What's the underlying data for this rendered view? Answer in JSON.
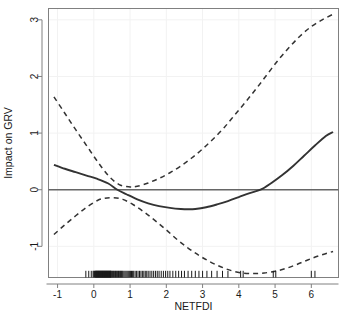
{
  "chart_data": {
    "type": "line",
    "title": "",
    "xlabel": "NETFDI",
    "ylabel": "Impact on GRV",
    "xlim": [
      -1.25,
      6.75
    ],
    "ylim": [
      -1.55,
      3.2
    ],
    "xticks": [
      -1,
      0,
      1,
      2,
      3,
      4,
      5,
      6
    ],
    "xtick_labels": [
      "-1",
      "0",
      "1",
      "2",
      "3",
      "4",
      "5",
      "6"
    ],
    "yticks": [
      -1,
      0,
      1,
      2,
      3
    ],
    "ytick_labels": [
      "-1",
      "0",
      "1",
      "2",
      "3"
    ],
    "grid": false,
    "legend": null,
    "reference_line_y": 0,
    "series": [
      {
        "name": "Estimated smooth effect",
        "style": "solid",
        "color": "#333333",
        "x": [
          -1.1,
          -0.8,
          -0.5,
          -0.2,
          0.1,
          0.4,
          0.65,
          0.9,
          1.2,
          1.5,
          1.8,
          2.1,
          2.4,
          2.6,
          2.8,
          3.1,
          3.4,
          3.7,
          4.0,
          4.3,
          4.6,
          4.9,
          5.2,
          5.5,
          5.8,
          6.1,
          6.4,
          6.6
        ],
        "values": [
          0.44,
          0.37,
          0.31,
          0.25,
          0.19,
          0.11,
          0.0,
          -0.08,
          -0.17,
          -0.24,
          -0.29,
          -0.32,
          -0.34,
          -0.345,
          -0.34,
          -0.31,
          -0.26,
          -0.2,
          -0.13,
          -0.06,
          0.0,
          0.12,
          0.26,
          0.42,
          0.6,
          0.78,
          0.95,
          1.02
        ]
      },
      {
        "name": "Upper 95% confidence band",
        "style": "dashed",
        "color": "#333333",
        "x": [
          -1.1,
          -0.8,
          -0.5,
          -0.2,
          0.1,
          0.4,
          0.7,
          1.0,
          1.2,
          1.5,
          1.8,
          2.1,
          2.4,
          2.7,
          3.0,
          3.3,
          3.6,
          3.9,
          4.2,
          4.5,
          4.8,
          5.1,
          5.4,
          5.7,
          6.0,
          6.3,
          6.6
        ],
        "values": [
          1.64,
          1.35,
          1.06,
          0.78,
          0.5,
          0.25,
          0.09,
          0.05,
          0.06,
          0.12,
          0.2,
          0.3,
          0.42,
          0.56,
          0.72,
          0.9,
          1.1,
          1.33,
          1.56,
          1.8,
          2.05,
          2.3,
          2.52,
          2.72,
          2.88,
          3.0,
          3.1
        ]
      },
      {
        "name": "Lower 95% confidence band",
        "style": "dashed",
        "color": "#333333",
        "x": [
          -1.1,
          -0.8,
          -0.5,
          -0.2,
          0.1,
          0.3,
          0.55,
          0.8,
          1.1,
          1.4,
          1.7,
          2.0,
          2.3,
          2.6,
          2.9,
          3.2,
          3.5,
          3.8,
          4.1,
          4.4,
          4.7,
          5.0,
          5.3,
          5.6,
          5.9,
          6.2,
          6.6
        ],
        "values": [
          -0.79,
          -0.62,
          -0.46,
          -0.31,
          -0.19,
          -0.15,
          -0.14,
          -0.17,
          -0.27,
          -0.4,
          -0.55,
          -0.71,
          -0.88,
          -1.03,
          -1.16,
          -1.27,
          -1.36,
          -1.43,
          -1.47,
          -1.48,
          -1.47,
          -1.44,
          -1.39,
          -1.32,
          -1.24,
          -1.17,
          -1.09
        ]
      }
    ],
    "rug": {
      "name": "data-rug-ticks",
      "y": -1.52,
      "values": [
        -0.22,
        -0.14,
        -0.07,
        -0.02,
        0.0,
        0.02,
        0.04,
        0.05,
        0.06,
        0.07,
        0.08,
        0.09,
        0.1,
        0.11,
        0.12,
        0.13,
        0.14,
        0.15,
        0.16,
        0.17,
        0.18,
        0.19,
        0.2,
        0.21,
        0.22,
        0.23,
        0.24,
        0.25,
        0.26,
        0.27,
        0.28,
        0.29,
        0.3,
        0.31,
        0.32,
        0.33,
        0.34,
        0.35,
        0.36,
        0.37,
        0.38,
        0.39,
        0.4,
        0.41,
        0.42,
        0.43,
        0.44,
        0.45,
        0.46,
        0.47,
        0.48,
        0.5,
        0.52,
        0.54,
        0.56,
        0.58,
        0.6,
        0.62,
        0.64,
        0.66,
        0.68,
        0.7,
        0.72,
        0.74,
        0.76,
        0.78,
        0.8,
        0.83,
        0.86,
        0.89,
        0.92,
        0.95,
        0.98,
        1.01,
        1.04,
        1.07,
        1.1,
        1.14,
        1.18,
        1.22,
        1.26,
        1.3,
        1.34,
        1.38,
        1.42,
        1.46,
        1.5,
        1.55,
        1.6,
        1.65,
        1.7,
        1.75,
        1.8,
        1.86,
        1.92,
        1.98,
        2.04,
        2.1,
        2.18,
        2.26,
        2.34,
        2.42,
        2.5,
        2.6,
        2.7,
        2.8,
        2.9,
        3.0,
        3.12,
        3.25,
        3.4,
        3.55,
        3.7,
        4.05,
        4.12,
        4.95,
        5.02,
        6.0,
        6.1
      ]
    }
  },
  "axes": {
    "x_axis_name": "x-axis",
    "y_axis_name": "y-axis",
    "xlabel": "NETFDI",
    "ylabel": "Impact on GRV"
  }
}
